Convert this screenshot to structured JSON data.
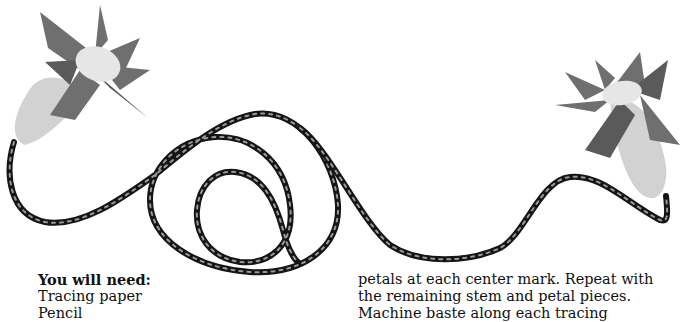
{
  "illustration": {
    "subject": "two felt flower puppets joined by a braided rope",
    "colors": {
      "petal": "#6f6f6f",
      "petal_dark": "#5a5a5a",
      "center": "#e6e6e6",
      "stem_sleeve": "#d2d2d2",
      "rope_dark": "#151515",
      "rope_light": "#9a9a9a"
    }
  },
  "left_column": {
    "heading": "You will need:",
    "items": [
      "Tracing paper",
      "Pencil"
    ]
  },
  "right_column": {
    "lines": [
      "petals at each center mark. Repeat with",
      "the remaining stem and petal pieces.",
      "Machine baste along each tracing"
    ]
  }
}
